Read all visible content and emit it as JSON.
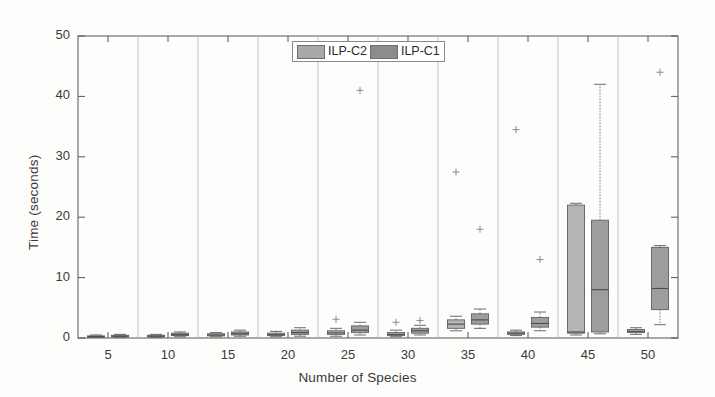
{
  "chart_data": {
    "type": "box",
    "title": "",
    "xlabel": "Number of Species",
    "ylabel": "Time (seconds)",
    "ylim": [
      0,
      50
    ],
    "yticks": [
      0,
      10,
      20,
      30,
      40,
      50
    ],
    "ytick_labels": [
      "0",
      "10",
      "20",
      "30",
      "40",
      "50"
    ],
    "categories": [
      5,
      10,
      15,
      20,
      25,
      30,
      35,
      40,
      45,
      50
    ],
    "xtick_labels": [
      "5",
      "10",
      "15",
      "20",
      "25",
      "30",
      "35",
      "40",
      "45",
      "50"
    ],
    "grid": false,
    "group_separators": true,
    "legend": {
      "position": "top-center",
      "entries": [
        {
          "label": "ILP-C2",
          "color": "#a8a8a8"
        },
        {
          "label": "ILP-C1",
          "color": "#8c8c8c"
        }
      ]
    },
    "series": [
      {
        "name": "ILP-C2",
        "color": "#a8a8a8",
        "boxes": [
          {
            "category": 5,
            "whisker_low": 0.1,
            "q1": 0.15,
            "median": 0.25,
            "q3": 0.35,
            "whisker_high": 0.5,
            "outliers": []
          },
          {
            "category": 10,
            "whisker_low": 0.1,
            "q1": 0.2,
            "median": 0.3,
            "q3": 0.45,
            "whisker_high": 0.6,
            "outliers": []
          },
          {
            "category": 15,
            "whisker_low": 0.2,
            "q1": 0.35,
            "median": 0.5,
            "q3": 0.7,
            "whisker_high": 0.9,
            "outliers": []
          },
          {
            "category": 20,
            "whisker_low": 0.2,
            "q1": 0.4,
            "median": 0.55,
            "q3": 0.8,
            "whisker_high": 1.1,
            "outliers": []
          },
          {
            "category": 25,
            "whisker_low": 0.3,
            "q1": 0.6,
            "median": 0.85,
            "q3": 1.2,
            "whisker_high": 1.6,
            "outliers": [
              3.1
            ]
          },
          {
            "category": 30,
            "whisker_low": 0.2,
            "q1": 0.4,
            "median": 0.6,
            "q3": 0.9,
            "whisker_high": 1.3,
            "outliers": [
              2.6
            ]
          },
          {
            "category": 35,
            "whisker_low": 1.2,
            "q1": 1.6,
            "median": 2.3,
            "q3": 3.0,
            "whisker_high": 3.6,
            "outliers": [
              27.5
            ]
          },
          {
            "category": 40,
            "whisker_low": 0.4,
            "q1": 0.6,
            "median": 0.8,
            "q3": 1.0,
            "whisker_high": 1.3,
            "outliers": [
              34.5
            ]
          },
          {
            "category": 45,
            "whisker_low": 0.5,
            "q1": 0.8,
            "median": 1.0,
            "q3": 22.0,
            "whisker_high": 22.3,
            "outliers": []
          },
          {
            "category": 50,
            "whisker_low": 0.6,
            "q1": 0.9,
            "median": 1.1,
            "q3": 1.4,
            "whisker_high": 1.7,
            "outliers": []
          }
        ]
      },
      {
        "name": "ILP-C1",
        "color": "#8c8c8c",
        "boxes": [
          {
            "category": 5,
            "whisker_low": 0.1,
            "q1": 0.2,
            "median": 0.3,
            "q3": 0.45,
            "whisker_high": 0.6,
            "outliers": []
          },
          {
            "category": 10,
            "whisker_low": 0.2,
            "q1": 0.4,
            "median": 0.55,
            "q3": 0.8,
            "whisker_high": 1.0,
            "outliers": []
          },
          {
            "category": 15,
            "whisker_low": 0.3,
            "q1": 0.5,
            "median": 0.7,
            "q3": 1.0,
            "whisker_high": 1.3,
            "outliers": []
          },
          {
            "category": 20,
            "whisker_low": 0.3,
            "q1": 0.6,
            "median": 0.9,
            "q3": 1.3,
            "whisker_high": 1.7,
            "outliers": []
          },
          {
            "category": 25,
            "whisker_low": 0.5,
            "q1": 0.9,
            "median": 1.3,
            "q3": 2.0,
            "whisker_high": 2.6,
            "outliers": [
              41.0
            ]
          },
          {
            "category": 30,
            "whisker_low": 0.5,
            "q1": 0.8,
            "median": 1.2,
            "q3": 1.6,
            "whisker_high": 2.1,
            "outliers": [
              2.9
            ]
          },
          {
            "category": 35,
            "whisker_low": 1.6,
            "q1": 2.3,
            "median": 3.0,
            "q3": 4.0,
            "whisker_high": 4.8,
            "outliers": [
              18.0
            ]
          },
          {
            "category": 40,
            "whisker_low": 1.2,
            "q1": 1.8,
            "median": 2.4,
            "q3": 3.4,
            "whisker_high": 4.3,
            "outliers": [
              13.0
            ]
          },
          {
            "category": 45,
            "whisker_low": 0.7,
            "q1": 1.0,
            "median": 8.0,
            "q3": 19.5,
            "whisker_high": 42.0,
            "outliers": []
          },
          {
            "category": 50,
            "whisker_low": 2.2,
            "q1": 4.7,
            "median": 8.2,
            "q3": 15.0,
            "whisker_high": 15.3,
            "outliers": [
              44.0
            ]
          }
        ]
      }
    ]
  },
  "axes": {
    "plot_left": 78,
    "plot_right": 678,
    "plot_top": 36,
    "plot_bottom": 338
  }
}
